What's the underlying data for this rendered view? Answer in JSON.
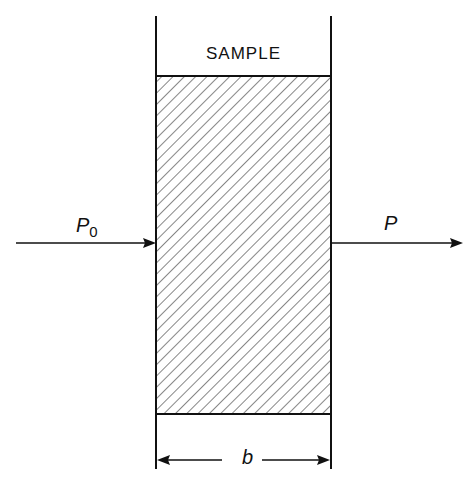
{
  "diagram": {
    "sample_label": "SAMPLE",
    "incident_power_label": "P",
    "incident_power_subscript": "0",
    "transmitted_power_label": "P",
    "thickness_label": "b",
    "colors": {
      "line": "#111111",
      "background": "#ffffff"
    }
  }
}
